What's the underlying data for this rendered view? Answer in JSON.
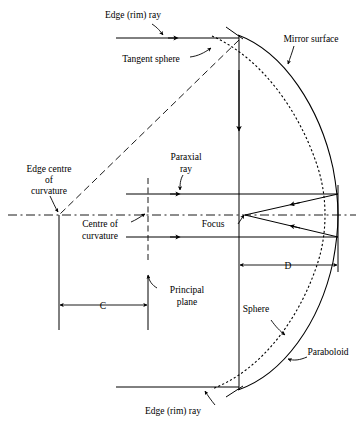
{
  "figure": {
    "type": "optical-ray-diagram",
    "title": "",
    "background_color": "#ffffff",
    "line_color": "#000000"
  },
  "labels": {
    "edge_rim_ray_top": "Edge (rim) ray",
    "tangent_sphere": "Tangent sphere",
    "mirror_surface": "Mirror surface",
    "edge_centre_line1": "Edge centre",
    "edge_centre_line2": "of",
    "edge_centre_line3": "curvature",
    "paraxial_line1": "Paraxial",
    "paraxial_line2": "ray",
    "centre_of_curvature_line1": "Centre of",
    "centre_of_curvature_line2": "curvature",
    "focus": "Focus",
    "principal_line1": "Principal",
    "principal_line2": "plane",
    "dimension_d": "D",
    "dimension_c": "C",
    "sphere": "Sphere",
    "paraboloid": "Paraboloid",
    "edge_rim_ray_bottom": "Edge (rim) ray"
  },
  "geometry": {
    "axis_y": 215,
    "vertex_x": 338,
    "aperture_plane_x": 239,
    "principal_plane_x": 148,
    "edge_centre_x": 59,
    "focus_x": 245,
    "rim_top_y": 35,
    "rim_bottom_y": 390,
    "c_dimension_y": 305,
    "d_dimension_y": 265
  }
}
